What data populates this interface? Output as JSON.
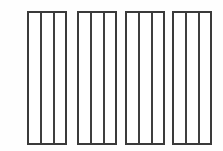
{
  "canvas": {
    "width": 223,
    "height": 151,
    "background_color": "#fefefe",
    "title": "Four vertical-slat panel sections"
  },
  "style": {
    "line_color": "#3a3a3a",
    "baluster_color": "#3f3f3f",
    "panel_fill": "#ffffff",
    "rail_thickness": 2,
    "stile_thickness": 2,
    "baluster_thickness": 2
  },
  "figure": {
    "panel_count": 4,
    "bays_per_panel": 3,
    "balusters_per_panel": 2,
    "panel_top": 11,
    "panel_bottom": 145,
    "panel_height": 134
  },
  "panels": [
    {
      "id": "panel-1",
      "label": "Panel 1",
      "x": 27,
      "y": 11,
      "width": 40,
      "height": 134,
      "baluster_offsets": [
        13,
        26
      ]
    },
    {
      "id": "panel-2",
      "label": "Panel 2",
      "x": 77,
      "y": 11,
      "width": 40,
      "height": 134,
      "baluster_offsets": [
        13,
        26
      ]
    },
    {
      "id": "panel-3",
      "label": "Panel 3",
      "x": 125,
      "y": 11,
      "width": 40,
      "height": 134,
      "baluster_offsets": [
        13,
        26
      ]
    },
    {
      "id": "panel-4",
      "label": "Panel 4",
      "x": 172,
      "y": 11,
      "width": 40,
      "height": 134,
      "baluster_offsets": [
        13,
        26
      ]
    }
  ]
}
